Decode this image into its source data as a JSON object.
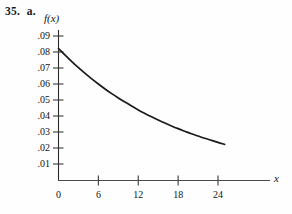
{
  "problem": {
    "number": "35.",
    "part": "a."
  },
  "chart_data": {
    "type": "line",
    "title": "",
    "subtitle": "",
    "xlabel": "x",
    "ylabel": "f(x)",
    "xlim": [
      0,
      26
    ],
    "ylim": [
      0,
      0.095
    ],
    "grid": false,
    "legend": null,
    "x_ticks": [
      0,
      6,
      12,
      18,
      24
    ],
    "x_tick_labels": [
      "0",
      "6",
      "12",
      "18",
      "24"
    ],
    "y_ticks": [
      0.01,
      0.02,
      0.03,
      0.04,
      0.05,
      0.06,
      0.07,
      0.08,
      0.09
    ],
    "y_tick_labels": [
      ".01",
      ".02",
      ".03",
      ".04",
      ".05",
      ".06",
      ".07",
      ".08",
      ".09"
    ],
    "series": [
      {
        "name": "f(x)",
        "color": "#1a1a1a",
        "x": [
          0,
          1,
          2,
          3,
          4,
          5,
          6,
          7,
          8,
          9,
          10,
          11,
          12,
          13,
          14,
          15,
          16,
          17,
          18,
          19,
          20,
          21,
          22,
          23,
          24,
          25
        ],
        "y": [
          0.0822,
          0.078,
          0.074,
          0.0702,
          0.0666,
          0.0632,
          0.06,
          0.0569,
          0.054,
          0.0513,
          0.0487,
          0.0462,
          0.0438,
          0.0416,
          0.0395,
          0.0375,
          0.0356,
          0.0338,
          0.0321,
          0.0305,
          0.0289,
          0.0275,
          0.0261,
          0.0248,
          0.0235,
          0.0223
        ]
      }
    ],
    "annotations": []
  },
  "axis_labels": {
    "y_axis_title": "f(x)",
    "x_axis_title": "x"
  }
}
